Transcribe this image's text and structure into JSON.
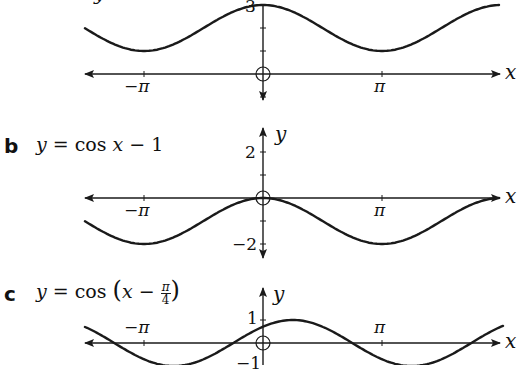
{
  "chart_data": [
    {
      "type": "line",
      "part": "a",
      "equation": "y = cos x + 2",
      "xlabel": "x",
      "ylabel": "y",
      "x_ticks": [
        "-π",
        "π"
      ],
      "y_ticks": [
        "3"
      ],
      "x_range": [
        -3.7,
        4.1
      ],
      "y_range": [
        -1.3,
        3.1
      ],
      "curve": {
        "amplitude": 1,
        "shift_x": 0,
        "shift_y": 2
      },
      "origin_y_px": 74
    },
    {
      "type": "line",
      "part": "b",
      "equation": "y = cos x − 1",
      "xlabel": "x",
      "ylabel": "y",
      "x_ticks": [
        "-π",
        "π"
      ],
      "y_ticks": [
        "2",
        "-2"
      ],
      "x_range": [
        -3.7,
        4.1
      ],
      "y_range": [
        -2.2,
        2.3
      ],
      "curve": {
        "amplitude": 1,
        "shift_x": 0,
        "shift_y": -1
      },
      "origin_y_px": 198
    },
    {
      "type": "line",
      "part": "c",
      "equation": "y = cos(x − π/4)",
      "xlabel": "x",
      "ylabel": "y",
      "x_ticks": [
        "-π",
        "π"
      ],
      "y_ticks": [
        "1",
        "-1"
      ],
      "x_range": [
        -3.7,
        4.1
      ],
      "y_range": [
        -1,
        2
      ],
      "curve": {
        "amplitude": 1,
        "shift_x": 0.7854,
        "shift_y": 0
      },
      "origin_y_px": 343
    }
  ],
  "labels": {
    "a": {
      "part": "",
      "y_tick_top": "3",
      "neg_pi": "−π",
      "pi": "π",
      "x": "x"
    },
    "b": {
      "part": "b",
      "eq_y": "y",
      "eq_rest": " = cos ",
      "eq_x": "x",
      "eq_tail": " − 1",
      "y_tick_top": "2",
      "y_tick_bottom": "−2",
      "neg_pi": "−π",
      "pi": "π",
      "x": "x",
      "y": "y"
    },
    "c": {
      "part": "c",
      "eq_y": "y",
      "eq_rest": " = cos ",
      "eq_paren": "(",
      "eq_x": "x",
      "eq_minus": " − ",
      "eq_frac_num": "π",
      "eq_frac_den": "4",
      "eq_paren_close": ")",
      "y_tick_top": "1",
      "y_tick_bottom": "−1",
      "neg_pi": "−π",
      "pi": "π",
      "x": "x",
      "y": "y"
    }
  },
  "colors": {
    "ink": "#1a1a1a",
    "background": "#ffffff"
  }
}
